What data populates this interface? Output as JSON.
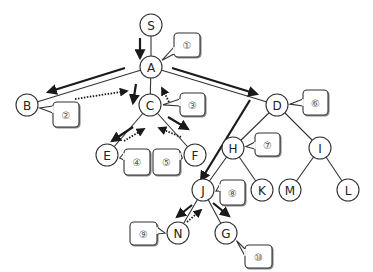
{
  "diagram": {
    "type": "tree-search-traversal",
    "colors": {
      "edge": "#333333",
      "arrow": "#1a1a1a",
      "node_stroke": "#333333",
      "node_fill": "#ffffff",
      "callout_stroke": "#333333",
      "callout_fill": "#ffffff",
      "callout_text": "#555555"
    },
    "nodes": [
      {
        "id": "S",
        "label": "S",
        "x": 151,
        "y": 25
      },
      {
        "id": "A",
        "label": "A",
        "x": 151,
        "y": 67
      },
      {
        "id": "B",
        "label": "B",
        "x": 27,
        "y": 105
      },
      {
        "id": "C",
        "label": "C",
        "x": 150,
        "y": 105
      },
      {
        "id": "D",
        "label": "D",
        "x": 277,
        "y": 105
      },
      {
        "id": "E",
        "label": "E",
        "x": 107,
        "y": 155
      },
      {
        "id": "F",
        "label": "F",
        "x": 195,
        "y": 155
      },
      {
        "id": "H",
        "label": "H",
        "x": 233,
        "y": 148
      },
      {
        "id": "I",
        "label": "I",
        "x": 320,
        "y": 148
      },
      {
        "id": "J",
        "label": "J",
        "x": 203,
        "y": 190
      },
      {
        "id": "K",
        "label": "K",
        "x": 262,
        "y": 190
      },
      {
        "id": "M",
        "label": "M",
        "x": 290,
        "y": 190
      },
      {
        "id": "L",
        "label": "L",
        "x": 348,
        "y": 190
      },
      {
        "id": "N",
        "label": "N",
        "x": 178,
        "y": 233
      },
      {
        "id": "G",
        "label": "G",
        "x": 226,
        "y": 233
      }
    ],
    "edges": [
      [
        "S",
        "A"
      ],
      [
        "A",
        "B"
      ],
      [
        "A",
        "C"
      ],
      [
        "A",
        "D"
      ],
      [
        "C",
        "E"
      ],
      [
        "C",
        "F"
      ],
      [
        "D",
        "H"
      ],
      [
        "D",
        "I"
      ],
      [
        "H",
        "J"
      ],
      [
        "H",
        "K"
      ],
      [
        "I",
        "M"
      ],
      [
        "I",
        "L"
      ],
      [
        "J",
        "N"
      ],
      [
        "J",
        "G"
      ]
    ],
    "callouts": [
      {
        "label": "①",
        "x": 174,
        "y": 33,
        "w": 26,
        "h": 24,
        "tail_to": "A"
      },
      {
        "label": "②",
        "x": 53,
        "y": 102,
        "w": 26,
        "h": 25,
        "tail_to": "B"
      },
      {
        "label": "③",
        "x": 180,
        "y": 93,
        "w": 25,
        "h": 23,
        "tail_to": "C"
      },
      {
        "label": "④",
        "x": 124,
        "y": 149,
        "w": 26,
        "h": 26,
        "tail_to": "E"
      },
      {
        "label": "⑤",
        "x": 153,
        "y": 149,
        "w": 27,
        "h": 26,
        "tail_to": "F"
      },
      {
        "label": "⑥",
        "x": 303,
        "y": 90,
        "w": 25,
        "h": 25,
        "tail_to": "D"
      },
      {
        "label": "⑦",
        "x": 255,
        "y": 133,
        "w": 25,
        "h": 23,
        "tail_to": "H"
      },
      {
        "label": "⑧",
        "x": 220,
        "y": 180,
        "w": 25,
        "h": 25,
        "tail_to": "J"
      },
      {
        "label": "⑨",
        "x": 130,
        "y": 222,
        "w": 27,
        "h": 23,
        "tail_to": "N"
      },
      {
        "label": "⑩",
        "x": 245,
        "y": 245,
        "w": 27,
        "h": 23,
        "tail_to": "G"
      }
    ],
    "arrows": [
      {
        "kind": "solid",
        "x1": 140,
        "y1": 38,
        "x2": 140,
        "y2": 58,
        "desc": "S to A"
      },
      {
        "kind": "solid",
        "x1": 125,
        "y1": 68,
        "x2": 48,
        "y2": 92,
        "desc": "A to B"
      },
      {
        "kind": "dotted",
        "x1": 75,
        "y1": 99,
        "x2": 127,
        "y2": 91,
        "desc": "B back to A"
      },
      {
        "kind": "solid",
        "x1": 136,
        "y1": 84,
        "x2": 133,
        "y2": 103,
        "desc": "A to C"
      },
      {
        "kind": "solid",
        "x1": 133,
        "y1": 127,
        "x2": 112,
        "y2": 141,
        "desc": "C to E"
      },
      {
        "kind": "dotted",
        "x1": 124,
        "y1": 141,
        "x2": 144,
        "y2": 129,
        "desc": "E back to C"
      },
      {
        "kind": "solid",
        "x1": 168,
        "y1": 117,
        "x2": 188,
        "y2": 129,
        "desc": "C to F"
      },
      {
        "kind": "dotted",
        "x1": 181,
        "y1": 137,
        "x2": 159,
        "y2": 128,
        "desc": "F back to C"
      },
      {
        "kind": "dotted",
        "x1": 169,
        "y1": 102,
        "x2": 162,
        "y2": 88,
        "desc": "C back to A"
      },
      {
        "kind": "solid",
        "x1": 172,
        "y1": 68,
        "x2": 257,
        "y2": 94,
        "desc": "A to D"
      },
      {
        "kind": "solid",
        "x1": 250,
        "y1": 100,
        "x2": 201,
        "y2": 180,
        "desc": "D to J (depth)"
      },
      {
        "kind": "solid",
        "x1": 192,
        "y1": 205,
        "x2": 177,
        "y2": 217,
        "desc": "J to N"
      },
      {
        "kind": "dotted",
        "x1": 187,
        "y1": 222,
        "x2": 201,
        "y2": 210,
        "desc": "N back to J"
      },
      {
        "kind": "solid",
        "x1": 213,
        "y1": 203,
        "x2": 229,
        "y2": 216,
        "desc": "J to G"
      }
    ]
  }
}
